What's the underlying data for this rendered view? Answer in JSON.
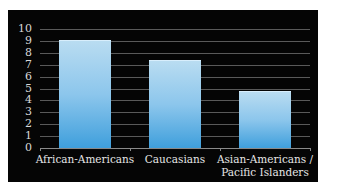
{
  "chart_data": {
    "type": "bar",
    "title": "",
    "xlabel": "",
    "ylabel": "",
    "categories": [
      "African-Americans",
      "Caucasians",
      "Asian-Americans / Pacific Islanders"
    ],
    "values": [
      9.1,
      7.4,
      4.8
    ],
    "ylim": [
      0,
      10
    ],
    "yticks": [
      0,
      1,
      2,
      3,
      4,
      5,
      6,
      7,
      8,
      9,
      10
    ],
    "grid": true,
    "legend": null,
    "colors": {
      "background": "#050505",
      "bar_top": "#b9dcf1",
      "bar_bottom": "#3f9fdc",
      "gridline": "#5a5a5a",
      "text": "#e6e6e6"
    }
  },
  "labels": {
    "y": [
      "0",
      "1",
      "2",
      "3",
      "4",
      "5",
      "6",
      "7",
      "8",
      "9",
      "10"
    ],
    "x": [
      "African-Americans",
      "Caucasians",
      "Asian-Americans /\nPacific Islanders"
    ]
  }
}
